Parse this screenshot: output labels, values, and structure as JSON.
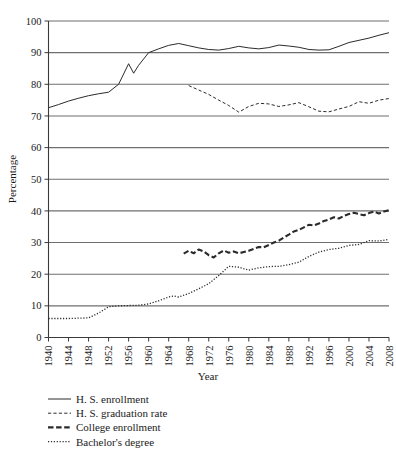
{
  "chart_data": {
    "type": "line",
    "title": "",
    "xlabel": "Year",
    "ylabel": "Percentage",
    "xlim": [
      1940,
      2008
    ],
    "ylim": [
      0,
      100
    ],
    "ytick_step": 10,
    "xtick_step": 4,
    "grid": true,
    "legend_position": "below-left",
    "yticks": [
      "0",
      "10",
      "20",
      "30",
      "40",
      "50",
      "60",
      "70",
      "80",
      "90",
      "100"
    ],
    "xticks": [
      "1940",
      "1944",
      "1948",
      "1952",
      "1956",
      "1960",
      "1964",
      "1968",
      "1972",
      "1976",
      "1980",
      "1984",
      "1988",
      "1992",
      "1996",
      "2000",
      "2004",
      "2008"
    ],
    "series": [
      {
        "name": "H. S. enrollment",
        "style": "solid",
        "x": [
          1940,
          1942,
          1944,
          1946,
          1948,
          1950,
          1952,
          1954,
          1956,
          1957,
          1958,
          1959,
          1960,
          1962,
          1964,
          1966,
          1968,
          1970,
          1972,
          1974,
          1976,
          1978,
          1980,
          1982,
          1984,
          1986,
          1988,
          1990,
          1992,
          1994,
          1996,
          1998,
          2000,
          2002,
          2004,
          2006,
          2008
        ],
        "y": [
          72.6,
          73.6,
          74.7,
          75.6,
          76.4,
          77.0,
          77.5,
          80.0,
          86.5,
          83.5,
          86.0,
          88.0,
          90.0,
          91.2,
          92.3,
          92.9,
          92.2,
          91.5,
          91.0,
          90.8,
          91.3,
          92.0,
          91.5,
          91.2,
          91.6,
          92.4,
          92.1,
          91.7,
          91.0,
          90.8,
          90.9,
          92.0,
          93.2,
          93.9,
          94.6,
          95.5,
          96.3
        ]
      },
      {
        "name": "H. S. graduation rate",
        "style": "dashed-fine",
        "x": [
          1968,
          1970,
          1972,
          1974,
          1976,
          1978,
          1980,
          1982,
          1984,
          1986,
          1988,
          1990,
          1992,
          1994,
          1996,
          1998,
          2000,
          2002,
          2004,
          2006,
          2008
        ],
        "y": [
          79.6,
          78.2,
          76.8,
          75.0,
          73.3,
          71.2,
          73.0,
          74.0,
          73.8,
          73.0,
          73.5,
          74.2,
          72.9,
          71.5,
          71.3,
          72.2,
          73.0,
          74.5,
          74.0,
          75.0,
          75.5
        ]
      },
      {
        "name": "College enrollment",
        "style": "dashed-bold",
        "x": [
          1967,
          1968,
          1969,
          1970,
          1971,
          1972,
          1973,
          1974,
          1975,
          1976,
          1977,
          1978,
          1979,
          1980,
          1981,
          1982,
          1983,
          1984,
          1985,
          1986,
          1987,
          1988,
          1989,
          1990,
          1991,
          1992,
          1993,
          1994,
          1995,
          1996,
          1997,
          1998,
          1999,
          2000,
          2001,
          2002,
          2003,
          2004,
          2005,
          2006,
          2007,
          2008
        ],
        "y": [
          26.5,
          27.4,
          26.6,
          27.8,
          27.2,
          26.0,
          25.3,
          26.6,
          27.5,
          26.8,
          27.2,
          26.6,
          27.0,
          27.4,
          28.0,
          28.6,
          28.5,
          29.2,
          30.0,
          30.6,
          31.6,
          32.5,
          33.5,
          34.0,
          34.8,
          35.6,
          35.4,
          36.0,
          36.8,
          37.3,
          38.0,
          37.6,
          38.4,
          39.0,
          39.4,
          39.0,
          38.6,
          39.3,
          39.8,
          39.2,
          39.8,
          40.2
        ]
      },
      {
        "name": "Bachelor's degree",
        "style": "dotted",
        "x": [
          1940,
          1942,
          1944,
          1946,
          1948,
          1950,
          1952,
          1954,
          1956,
          1958,
          1960,
          1962,
          1964,
          1965,
          1966,
          1968,
          1970,
          1972,
          1974,
          1975,
          1976,
          1978,
          1980,
          1982,
          1984,
          1986,
          1988,
          1990,
          1992,
          1994,
          1996,
          1998,
          2000,
          2002,
          2004,
          2006,
          2008
        ],
        "y": [
          6.0,
          6.0,
          6.0,
          6.1,
          6.2,
          7.7,
          9.7,
          10.0,
          10.1,
          10.2,
          10.6,
          11.6,
          12.8,
          13.1,
          12.8,
          13.9,
          15.4,
          17.0,
          19.6,
          21.0,
          22.5,
          22.2,
          21.3,
          22.0,
          22.4,
          22.5,
          23.0,
          23.8,
          25.6,
          27.0,
          27.8,
          28.2,
          29.1,
          29.4,
          30.6,
          30.5,
          31.0
        ]
      }
    ]
  },
  "legend": {
    "items": [
      {
        "label": "H. S. enrollment",
        "style": "solid"
      },
      {
        "label": "H. S. graduation rate",
        "style": "dashed-fine"
      },
      {
        "label": "College enrollment",
        "style": "dashed-bold"
      },
      {
        "label": "Bachelor's degree",
        "style": "dotted"
      }
    ]
  }
}
